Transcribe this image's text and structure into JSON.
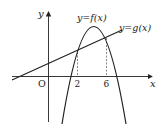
{
  "diagram": {
    "type": "function-graph",
    "curves": [
      {
        "name": "f",
        "label": "y=f(x)",
        "shape": "downward parabola"
      },
      {
        "name": "g",
        "label": "y=g(x)",
        "shape": "increasing line"
      }
    ],
    "axes": {
      "x_label": "x",
      "y_label": "y",
      "origin_label": "O"
    },
    "intersections": [
      {
        "x_label": "2"
      },
      {
        "x_label": "6"
      }
    ],
    "colors": {
      "stroke": "#222222",
      "dashed": "#555555",
      "background": "#ffffff"
    }
  }
}
